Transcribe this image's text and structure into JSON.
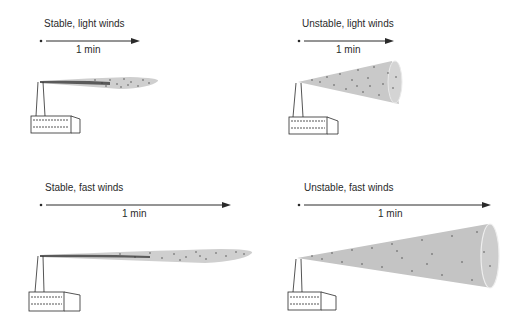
{
  "panels": [
    {
      "id": "stable-light",
      "title": "Stable, light winds",
      "time_label": "1 min",
      "stability": "stable",
      "wind": "light",
      "plume_shape": "thin fanning plume"
    },
    {
      "id": "unstable-light",
      "title": "Unstable, light winds",
      "time_label": "1 min",
      "stability": "unstable",
      "wind": "light",
      "plume_shape": "wide short cone"
    },
    {
      "id": "stable-fast",
      "title": "Stable, fast winds",
      "time_label": "1 min",
      "stability": "stable",
      "wind": "fast",
      "plume_shape": "long thin plume"
    },
    {
      "id": "unstable-fast",
      "title": "Unstable, fast winds",
      "time_label": "1 min",
      "stability": "unstable",
      "wind": "fast",
      "plume_shape": "long wide cone"
    }
  ],
  "colors": {
    "plume_fill": "#c9c9c9",
    "plume_dots": "#3a3a3a",
    "ink": "#2a2a2a",
    "background": "#ffffff"
  }
}
